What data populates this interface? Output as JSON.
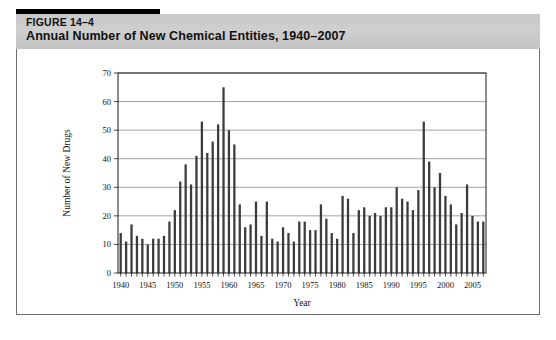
{
  "figure": {
    "number": "FIGURE 14–4",
    "title": "Annual Number of New Chemical Entities, 1940–2007"
  },
  "colors": {
    "accent_bar": "#000000",
    "header_band": "#c8c8c8",
    "bar_fill": "#3b3b3b",
    "grid": "#8c8c8c",
    "axis": "#1a1a1a",
    "panel_border": "#6e6e6e",
    "background": "#ffffff"
  },
  "chart_data": {
    "type": "bar",
    "title": "Annual Number of New Chemical Entities, 1940–2007",
    "xlabel": "Year",
    "ylabel": "Number of New Drugs",
    "xlim": [
      1939,
      2008
    ],
    "ylim": [
      0,
      70
    ],
    "ytick_step": 10,
    "yticks": [
      0,
      10,
      20,
      30,
      40,
      50,
      60,
      70
    ],
    "xtick_step": 1,
    "xtick_labels": [
      1940,
      1945,
      1950,
      1955,
      1960,
      1965,
      1970,
      1975,
      1980,
      1985,
      1990,
      1995,
      2000,
      2005
    ],
    "grid": "horizontal",
    "legend": "none",
    "categories": [
      1940,
      1941,
      1942,
      1943,
      1944,
      1945,
      1946,
      1947,
      1948,
      1949,
      1950,
      1951,
      1952,
      1953,
      1954,
      1955,
      1956,
      1957,
      1958,
      1959,
      1960,
      1961,
      1962,
      1963,
      1964,
      1965,
      1966,
      1967,
      1968,
      1969,
      1970,
      1971,
      1972,
      1973,
      1974,
      1975,
      1976,
      1977,
      1978,
      1979,
      1980,
      1981,
      1982,
      1983,
      1984,
      1985,
      1986,
      1987,
      1988,
      1989,
      1990,
      1991,
      1992,
      1993,
      1994,
      1995,
      1996,
      1997,
      1998,
      1999,
      2000,
      2001,
      2002,
      2003,
      2004,
      2005,
      2006,
      2007
    ],
    "values": [
      14,
      11,
      17,
      13,
      12,
      10,
      12,
      12,
      13,
      18,
      22,
      32,
      38,
      31,
      41,
      53,
      42,
      46,
      52,
      65,
      50,
      45,
      24,
      16,
      17,
      25,
      13,
      25,
      12,
      11,
      16,
      14,
      11,
      18,
      18,
      15,
      15,
      24,
      19,
      14,
      12,
      27,
      26,
      14,
      22,
      23,
      20,
      21,
      20,
      23,
      23,
      30,
      26,
      25,
      22,
      29,
      53,
      39,
      30,
      35,
      27,
      24,
      17,
      21,
      31,
      20,
      18,
      18
    ]
  }
}
